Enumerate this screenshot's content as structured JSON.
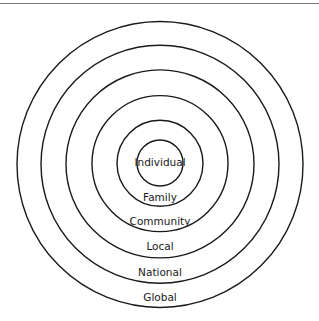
{
  "diagram": {
    "type": "concentric-circles",
    "levels": [
      {
        "label": "Individual"
      },
      {
        "label": "Family"
      },
      {
        "label": "Community"
      },
      {
        "label": "Local"
      },
      {
        "label": "National"
      },
      {
        "label": "Global"
      }
    ]
  }
}
